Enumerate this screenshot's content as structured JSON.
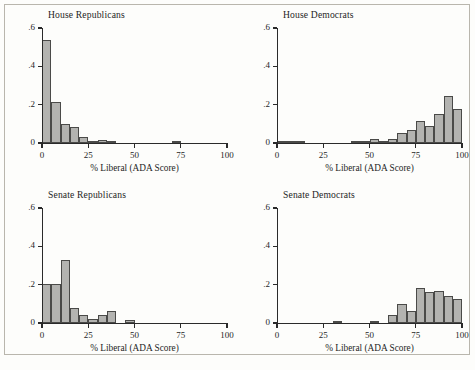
{
  "figure": {
    "background_color": "#fdfdfb",
    "frame_color": "#b9b6ad",
    "bar_fill_color": "#b3b3b0",
    "bar_edge_color": "#4a4a48",
    "axis_color": "#2a2a2a",
    "footer_note": ""
  },
  "shared": {
    "xlabel": "% Liberal (ADA Score)",
    "ylabel": "",
    "xticks": [
      "0",
      "25",
      "50",
      "75",
      "100"
    ],
    "yticks": [
      "0",
      ".2",
      ".4",
      ".6"
    ]
  },
  "chart_data": [
    {
      "type": "bar",
      "title": "House Republicans",
      "xlabel": "% Liberal (ADA Score)",
      "ylabel": "",
      "xlim": [
        0,
        100
      ],
      "ylim": [
        0,
        0.6
      ],
      "xticks": [
        0,
        25,
        50,
        75,
        100
      ],
      "yticks": [
        0,
        0.2,
        0.4,
        0.6
      ],
      "xtick_labels": [
        "0",
        "25",
        "50",
        "75",
        "100"
      ],
      "ytick_labels": [
        "0",
        ".2",
        ".4",
        ".6"
      ],
      "grid": false,
      "bin_width": 5,
      "bin_starts": [
        0,
        5,
        10,
        15,
        20,
        25,
        30,
        35,
        70
      ],
      "values": [
        0.535,
        0.212,
        0.1,
        0.082,
        0.03,
        0.008,
        0.018,
        0.004,
        0.006
      ]
    },
    {
      "type": "bar",
      "title": "House Democrats",
      "xlabel": "% Liberal (ADA Score)",
      "ylabel": "",
      "xlim": [
        0,
        100
      ],
      "ylim": [
        0,
        0.6
      ],
      "xticks": [
        0,
        25,
        50,
        75,
        100
      ],
      "yticks": [
        0,
        0.2,
        0.4,
        0.6
      ],
      "xtick_labels": [
        "0",
        "25",
        "50",
        "75",
        "100"
      ],
      "ytick_labels": [
        "0",
        ".2",
        ".4",
        ".6"
      ],
      "grid": false,
      "bin_width": 5,
      "bin_starts": [
        0,
        5,
        10,
        40,
        45,
        50,
        55,
        60,
        65,
        70,
        75,
        80,
        85,
        90,
        95
      ],
      "values": [
        0.004,
        0.004,
        0.004,
        0.008,
        0.012,
        0.02,
        0.01,
        0.021,
        0.05,
        0.069,
        0.113,
        0.09,
        0.152,
        0.245,
        0.176
      ]
    },
    {
      "type": "bar",
      "title": "Senate Republicans",
      "xlabel": "% Liberal (ADA Score)",
      "ylabel": "",
      "xlim": [
        0,
        100
      ],
      "ylim": [
        0,
        0.6
      ],
      "xticks": [
        0,
        25,
        50,
        75,
        100
      ],
      "yticks": [
        0,
        0.2,
        0.4,
        0.6
      ],
      "xtick_labels": [
        "0",
        "25",
        "50",
        "75",
        "100"
      ],
      "ytick_labels": [
        "0",
        ".2",
        ".4",
        ".6"
      ],
      "grid": false,
      "bin_width": 5,
      "bin_starts": [
        0,
        5,
        10,
        15,
        20,
        25,
        30,
        35,
        45
      ],
      "values": [
        0.205,
        0.205,
        0.33,
        0.08,
        0.04,
        0.02,
        0.042,
        0.062,
        0.014
      ]
    },
    {
      "type": "bar",
      "title": "Senate Democrats",
      "xlabel": "% Liberal (ADA Score)",
      "ylabel": "",
      "xlim": [
        0,
        100
      ],
      "ylim": [
        0,
        0.6
      ],
      "xticks": [
        0,
        25,
        50,
        75,
        100
      ],
      "yticks": [
        0,
        0.2,
        0.4,
        0.6
      ],
      "xtick_labels": [
        "0",
        "25",
        "50",
        "75",
        "100"
      ],
      "ytick_labels": [
        "0",
        ".2",
        ".4",
        ".6"
      ],
      "grid": false,
      "bin_width": 5,
      "bin_starts": [
        30,
        50,
        60,
        65,
        70,
        75,
        80,
        85,
        90,
        95
      ],
      "values": [
        0.012,
        0.012,
        0.04,
        0.1,
        0.063,
        0.182,
        0.163,
        0.165,
        0.143,
        0.125
      ]
    }
  ]
}
